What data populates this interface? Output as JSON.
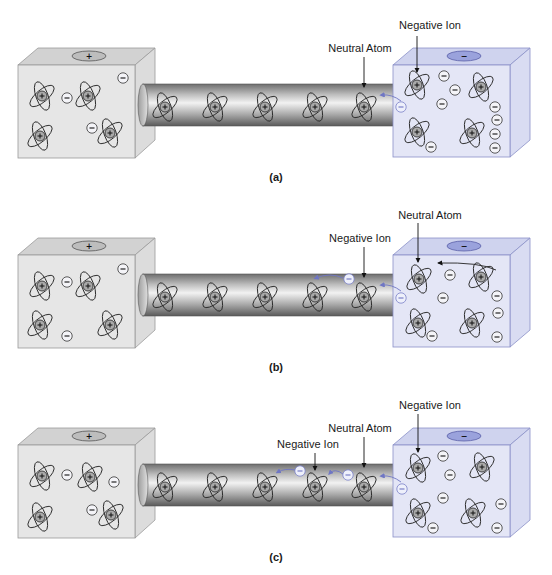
{
  "colors": {
    "left_box_face": "#e6e6e6",
    "left_box_top": "#d2d2d2",
    "left_box_side": "#dcdcdc",
    "left_box_stroke": "#9a9a9a",
    "right_box_face": "#e4e6f6",
    "right_box_top": "#cfd3ee",
    "right_box_side": "#d9dcf2",
    "right_box_stroke": "#8a90c8",
    "terminal_pos": "#bdbdbd",
    "terminal_neg": "#9aa2dc",
    "electron_path": "#6f76c4",
    "orbit": "#2a2a2a",
    "nucleus": "#a9a9a9"
  },
  "panels": [
    {
      "id": "a",
      "caption": "(a)",
      "offset_y": 0,
      "left_terminal": "+",
      "right_terminal": "−",
      "annotations": [
        {
          "text": "Negative Ion",
          "tx": 430,
          "ty": 29,
          "ax": 417,
          "ay": 36,
          "bx": 417,
          "by": 72
        },
        {
          "text": "Neutral Atom",
          "tx": 360,
          "ty": 52,
          "ax": 364,
          "ay": 57,
          "bx": 364,
          "by": 87
        }
      ],
      "left_atoms": [
        [
          42,
          96
        ],
        [
          88,
          96
        ],
        [
          40,
          136
        ],
        [
          110,
          133
        ]
      ],
      "left_ions": [
        [
          67,
          98
        ],
        [
          123,
          78
        ],
        [
          92,
          128
        ]
      ],
      "wire_atoms": [
        [
          165,
          107
        ],
        [
          215,
          107
        ],
        [
          265,
          107
        ],
        [
          315,
          107
        ],
        [
          364,
          107
        ]
      ],
      "wire_ions": [],
      "right_atoms": [
        [
          417,
          85
        ],
        [
          481,
          87
        ],
        [
          417,
          132
        ],
        [
          472,
          133
        ]
      ],
      "right_ions": [
        [
          444,
          76
        ],
        [
          455,
          90
        ],
        [
          442,
          104
        ],
        [
          495,
          107
        ],
        [
          497,
          120
        ],
        [
          495,
          134
        ],
        [
          431,
          147
        ],
        [
          495,
          148
        ]
      ],
      "free_ions": [
        [
          401,
          107
        ]
      ],
      "arrows": [
        [
          [
            401,
            101
          ],
          [
            392,
            94
          ],
          [
            382,
            95
          ]
        ]
      ]
    },
    {
      "id": "b",
      "caption": "(b)",
      "offset_y": 190,
      "left_terminal": "+",
      "right_terminal": "−",
      "annotations": [
        {
          "text": "Neutral Atom",
          "tx": 430,
          "ty": 29,
          "ax": 418,
          "ay": 33,
          "bx": 418,
          "by": 72
        },
        {
          "text": "Negative Ion",
          "tx": 360,
          "ty": 52,
          "ax": 364,
          "ay": 57,
          "bx": 364,
          "by": 87
        }
      ],
      "left_atoms": [
        [
          42,
          96
        ],
        [
          88,
          96
        ],
        [
          40,
          135
        ],
        [
          110,
          135
        ]
      ],
      "left_ions": [
        [
          67,
          92
        ],
        [
          123,
          79
        ],
        [
          67,
          146
        ]
      ],
      "wire_atoms": [
        [
          165,
          107
        ],
        [
          215,
          107
        ],
        [
          265,
          107
        ],
        [
          315,
          107
        ],
        [
          364,
          107
        ]
      ],
      "wire_ions": [
        [
          349,
          89
        ]
      ],
      "right_atoms": [
        [
          419,
          89
        ],
        [
          481,
          87
        ],
        [
          418,
          133
        ],
        [
          472,
          133
        ]
      ],
      "right_ions": [
        [
          450,
          85
        ],
        [
          443,
          108
        ],
        [
          497,
          106
        ],
        [
          498,
          123
        ],
        [
          432,
          146
        ],
        [
          497,
          147
        ]
      ],
      "free_ions": [
        [
          401,
          108
        ]
      ],
      "arrows": [
        [
          [
            343,
            88
          ],
          [
            330,
            82
          ],
          [
            316,
            88
          ]
        ],
        [
          [
            401,
            101
          ],
          [
            392,
            94
          ],
          [
            382,
            95
          ]
        ],
        [
          [
            496,
            80
          ],
          [
            480,
            72
          ],
          [
            438,
            73
          ]
        ]
      ]
    },
    {
      "id": "c",
      "caption": "(c)",
      "offset_y": 380,
      "left_terminal": "+",
      "right_terminal": "−",
      "annotations": [
        {
          "text": "Negative Ion",
          "tx": 430,
          "ty": 29,
          "ax": 418,
          "ay": 34,
          "bx": 418,
          "by": 72
        },
        {
          "text": "Neutral Atom",
          "tx": 360,
          "ty": 52,
          "ax": 364,
          "ay": 57,
          "bx": 364,
          "by": 87
        },
        {
          "text": "Negative Ion",
          "tx": 308,
          "ty": 68,
          "ax": 315,
          "ay": 73,
          "bx": 315,
          "by": 90
        }
      ],
      "left_atoms": [
        [
          42,
          96
        ],
        [
          90,
          97
        ],
        [
          40,
          137
        ],
        [
          111,
          135
        ]
      ],
      "left_ions": [
        [
          67,
          95
        ],
        [
          114,
          102
        ],
        [
          92,
          130
        ]
      ],
      "wire_atoms": [
        [
          165,
          107
        ],
        [
          215,
          107
        ],
        [
          265,
          107
        ],
        [
          315,
          107
        ],
        [
          364,
          107
        ]
      ],
      "wire_ions": [
        [
          300,
          91
        ],
        [
          348,
          95
        ]
      ],
      "right_atoms": [
        [
          418,
          88
        ],
        [
          482,
          87
        ],
        [
          418,
          133
        ],
        [
          473,
          133
        ]
      ],
      "right_ions": [
        [
          443,
          76
        ],
        [
          450,
          95
        ],
        [
          443,
          118
        ],
        [
          501,
          124
        ],
        [
          433,
          148
        ],
        [
          497,
          148
        ]
      ],
      "free_ions": [
        [
          402,
          109
        ]
      ],
      "arrows": [
        [
          [
            295,
            90
          ],
          [
            285,
            88
          ],
          [
            278,
            92
          ]
        ],
        [
          [
            343,
            94
          ],
          [
            335,
            88
          ],
          [
            330,
            93
          ]
        ],
        [
          [
            401,
            102
          ],
          [
            392,
            95
          ],
          [
            382,
            96
          ]
        ]
      ]
    }
  ]
}
